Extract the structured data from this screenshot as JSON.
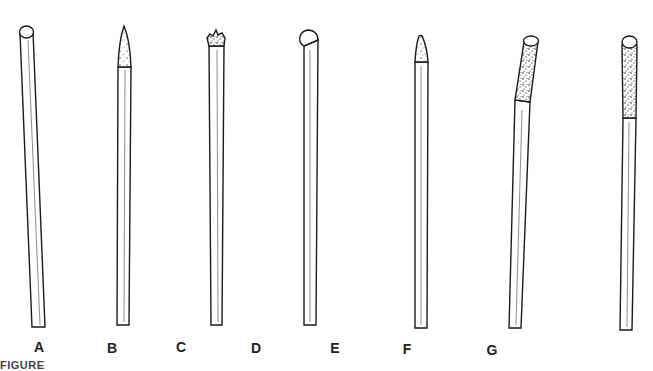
{
  "figure": {
    "caption": "FIGURE",
    "stroke_color": "#1a1a1a",
    "background": "#ffffff",
    "electrodes": [
      {
        "label": "A",
        "tip": "rounded-clean",
        "description": "clean rod with rounded tip"
      },
      {
        "label": "B",
        "tip": "pointed",
        "description": "sharpened conical point"
      },
      {
        "label": "C",
        "tip": "contaminated-ball",
        "description": "jagged contaminated tip"
      },
      {
        "label": "D",
        "tip": "balled-offset",
        "description": "off-center balled end"
      },
      {
        "label": "E",
        "tip": "truncated-point",
        "description": "blunted point"
      },
      {
        "label": "F",
        "tip": "bent-oxidized",
        "description": "bent tip with oxidized coating"
      },
      {
        "label": "G",
        "tip": "oxidized-ball",
        "description": "balled end with heavy oxidation"
      }
    ]
  }
}
